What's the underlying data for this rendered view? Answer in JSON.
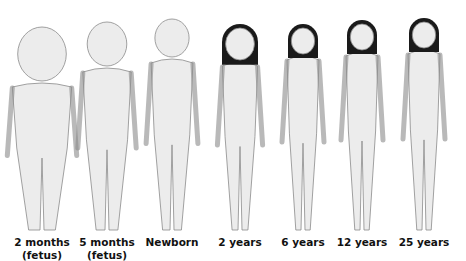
{
  "figures": [
    {
      "label": "2 months",
      "sublabel": "(fetus)",
      "cx": 42,
      "head_top": 27,
      "head_r": 27,
      "feet_y": 230,
      "hair": false
    },
    {
      "label": "5 months",
      "sublabel": "(fetus)",
      "cx": 107,
      "head_top": 22,
      "head_r": 22,
      "feet_y": 230,
      "hair": false
    },
    {
      "label": "Newborn",
      "sublabel": "",
      "cx": 172,
      "head_top": 19,
      "head_r": 19,
      "feet_y": 230,
      "hair": false
    },
    {
      "label": "2 years",
      "sublabel": "",
      "cx": 240,
      "head_top": 28,
      "head_r": 16,
      "feet_y": 230,
      "hair": true
    },
    {
      "label": "6 years",
      "sublabel": "",
      "cx": 303,
      "head_top": 28,
      "head_r": 13,
      "feet_y": 230,
      "hair": true
    },
    {
      "label": "12 years",
      "sublabel": "",
      "cx": 362,
      "head_top": 24,
      "head_r": 13,
      "feet_y": 230,
      "hair": true
    },
    {
      "label": "25 years",
      "sublabel": "",
      "cx": 424,
      "head_top": 22,
      "head_r": 13,
      "feet_y": 230,
      "hair": true
    }
  ],
  "colors": {
    "skin": "#ececec",
    "outline": "#8a8a8a",
    "hair": "#1a1a1a",
    "text": "#111111"
  }
}
